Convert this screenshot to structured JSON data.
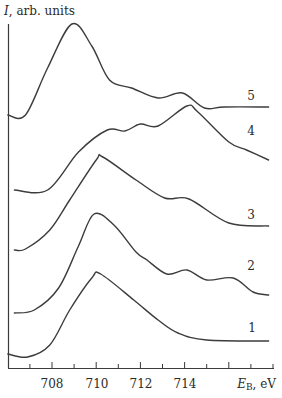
{
  "chart_data": {
    "type": "line",
    "title": "",
    "ylabel": "I, arb. units",
    "ylabel_parts": {
      "symbol": "I",
      "rest": ", arb. units"
    },
    "xlabel": "E_B, eV",
    "xlabel_parts": {
      "symbol": "E",
      "sub": "B",
      "rest": ", eV"
    },
    "xlim": [
      706.0,
      718.0
    ],
    "x_major_ticks": [
      708,
      710,
      712,
      714,
      716
    ],
    "x_minor_ticks": [
      707,
      709,
      711,
      713,
      715,
      717,
      718
    ],
    "x_tick_labels": [
      "708",
      "710",
      "712",
      "714"
    ],
    "grid": false,
    "legend": "inline curve numbers at right end",
    "note": "Curves are vertically offset spectra; y values are relative pixel-derived intensities (0 = bottom of axis, higher = more intense).",
    "series": [
      {
        "name": "1",
        "label": "1",
        "x": [
          706.0,
          706.9,
          707.9,
          708.8,
          709.8,
          710.2,
          711.7,
          712.8,
          713.7,
          715.0,
          717.8
        ],
        "y": [
          14,
          11,
          23,
          58,
          90,
          94,
          68,
          48,
          35,
          28,
          27
        ]
      },
      {
        "name": "2",
        "label": "2",
        "x": [
          706.3,
          707.2,
          708.3,
          709.2,
          709.9,
          710.8,
          711.8,
          712.3,
          713.2,
          714.1,
          715.0,
          716.2,
          717.1,
          717.8
        ],
        "y": [
          55,
          58,
          80,
          122,
          154,
          143,
          116,
          108,
          94,
          98,
          88,
          90,
          76,
          73
        ]
      },
      {
        "name": "3",
        "label": "3",
        "x": [
          706.3,
          706.8,
          707.9,
          708.8,
          710.0,
          710.3,
          711.8,
          713.1,
          714.2,
          716.0,
          717.8
        ],
        "y": [
          118,
          119,
          138,
          168,
          208,
          211,
          188,
          170,
          169,
          145,
          142
        ]
      },
      {
        "name": "4",
        "label": "4",
        "x": [
          706.3,
          707.8,
          709.2,
          710.5,
          711.3,
          712.0,
          712.8,
          714.1,
          714.6,
          716.0,
          716.8,
          717.8
        ],
        "y": [
          178,
          178,
          216,
          238,
          237,
          244,
          242,
          262,
          256,
          226,
          218,
          208
        ]
      },
      {
        "name": "5",
        "label": "5",
        "x": [
          706.0,
          706.8,
          707.8,
          708.9,
          709.8,
          710.6,
          711.6,
          712.8,
          713.9,
          714.9,
          715.8,
          717.8
        ],
        "y": [
          253,
          253,
          300,
          344,
          322,
          288,
          280,
          270,
          275,
          260,
          261,
          261
        ]
      }
    ],
    "label_positions": {
      "1": [
        252,
        328
      ],
      "2": [
        251,
        266
      ],
      "3": [
        251,
        215
      ],
      "4": [
        251,
        131
      ],
      "5": [
        251,
        96
      ]
    }
  },
  "axis": {
    "y_title_symbol": "I",
    "y_title_rest": ", arb. units",
    "x_title_symbol": "E",
    "x_title_sub": "B",
    "x_title_rest": ", eV",
    "tick_labels": [
      "708",
      "710",
      "712",
      "714"
    ]
  },
  "curve_labels": [
    "1",
    "2",
    "3",
    "4",
    "5"
  ],
  "colors": {
    "ink": "#3c3c3c",
    "background": "#ffffff"
  }
}
